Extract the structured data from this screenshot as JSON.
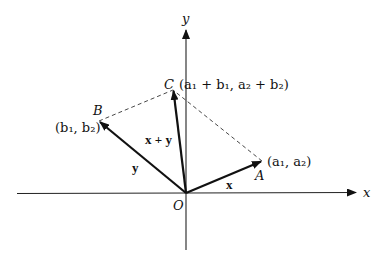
{
  "diagram": {
    "type": "vector-addition-parallelogram",
    "axes": {
      "x_label": "x",
      "y_label": "y",
      "origin_label": "O"
    },
    "points": {
      "A": {
        "label": "A",
        "coords": "(a₁, a₂)"
      },
      "B": {
        "label": "B",
        "coords": "(b₁, b₂)"
      },
      "C": {
        "label": "C",
        "coords": "(a₁ + b₁, a₂ + b₂)"
      }
    },
    "vectors": {
      "x": {
        "label": "x",
        "from": "O",
        "to": "A"
      },
      "y": {
        "label": "y",
        "from": "O",
        "to": "B"
      },
      "sum": {
        "label": "x + y",
        "from": "O",
        "to": "C"
      }
    },
    "dashed_edges": [
      "B-C",
      "A-C"
    ],
    "colors": {
      "ink": "#111111",
      "background": "#ffffff"
    }
  }
}
